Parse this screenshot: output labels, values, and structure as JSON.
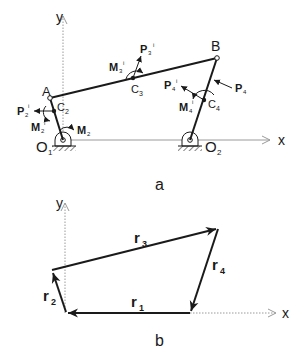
{
  "figure_a": {
    "caption": "a",
    "axes": {
      "x_label": "x",
      "y_label": "y"
    },
    "points": {
      "O1": {
        "label": "O",
        "sub": "1"
      },
      "O2": {
        "label": "O",
        "sub": "2"
      },
      "A": {
        "label": "A"
      },
      "B": {
        "label": "B"
      },
      "C2": {
        "label": "C",
        "sub": "2"
      },
      "C3": {
        "label": "C",
        "sub": "3"
      },
      "C4": {
        "label": "C",
        "sub": "4"
      }
    },
    "forces": {
      "P2": {
        "label": "P",
        "sub": "2",
        "sup": "i"
      },
      "P3": {
        "label": "P",
        "sub": "3",
        "sup": "i"
      },
      "P4i": {
        "label": "P",
        "sub": "4",
        "sup": "i"
      },
      "P4": {
        "label": "P",
        "sub": "4"
      }
    },
    "moments": {
      "M2i": {
        "label": "M",
        "sub": "2",
        "sup": "i"
      },
      "M2": {
        "label": "M",
        "sub": "2"
      },
      "M3i": {
        "label": "M",
        "sub": "3",
        "sup": "i"
      },
      "M4i": {
        "label": "M",
        "sub": "4",
        "sup": "i"
      }
    }
  },
  "figure_b": {
    "caption": "b",
    "axes": {
      "x_label": "x",
      "y_label": "y"
    },
    "vectors": {
      "r1": {
        "label": "r",
        "sub": "1"
      },
      "r2": {
        "label": "r",
        "sub": "2"
      },
      "r3": {
        "label": "r",
        "sub": "3"
      },
      "r4": {
        "label": "r",
        "sub": "4"
      }
    }
  },
  "colors": {
    "link": "#1a1a1a",
    "axis": "#9a9a9a"
  }
}
